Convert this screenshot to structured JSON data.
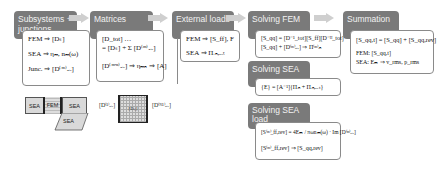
{
  "stages": [
    {
      "title": "Subsystems + junctions",
      "lines": [
        "FEM ⇒ [Dₛ]",
        "SEA ⇒ ηₘ, nₘ(ω)",
        "Junc. ⇒ [D⁽ᵐ⁾ₐᵢᵣ]"
      ]
    },
    {
      "title": "Matrices",
      "lines": [
        "[D_tot] …",
        "= [Dₛ] + Σ [D⁽ᵐ⁾ₐᵢᵣ]",
        "[D⁽ᵐ'ⁿ⁾ₐᵢᵣ] ⇒ ηₘₙ ⇒ [A]"
      ]
    },
    {
      "title": "External loads",
      "lines": [
        "FEM ⇒ [S_ff], F",
        "SEA ⇒ Πᵢₙ,ₑₓₜ"
      ]
    },
    {
      "title": "Solving FEM",
      "lines": [
        "[S_qq] = [D⁻¹_tot][S_ff][D⁻ᴴ_tot]",
        "[S_qq] + [D⁽ᵐ⁾ₐᵢᵣ] ⇒ Π⁽ᵐ⁾ᵢₙ"
      ]
    },
    {
      "title": "Solving SEA",
      "lines": [
        "{E} = [A⁻¹]{Πᵢₙ + Πᵢₙ,ₑₓₜ}"
      ]
    },
    {
      "title": "Solving SEA load",
      "lines": [
        "[S⁽ᵐ⁾_ff,rev] = 4Eₘ / πωnₘ(ω) · Im [D⁽ᵐ⁾ₐᵢᵣ]",
        "[S⁽ᵐ⁾_ff,rev] ⇒ [S_qq,rev]"
      ]
    },
    {
      "title": "Summation",
      "lines": [
        "[S_qq,t] = [S_qq] + [S_qq,rev]",
        "FEM: [S_qq,t]",
        "SEA:  Eₘ ⇒ v_rms, p_rms"
      ]
    }
  ],
  "illustration": {
    "blocks": [
      "SEA",
      "FEM",
      "SEA",
      "SEA"
    ],
    "matrix_center": "[Dₛ]",
    "left_label": "[D⁽¹⁾ₐᵢᵣ]",
    "right_label": "[D⁽ᴺ¹⁾ₐᵢᵣ]"
  },
  "colors": {
    "header_bg": "#7a7a7a",
    "arrow": "#cfcfcf",
    "border": "#8a8a8a"
  }
}
